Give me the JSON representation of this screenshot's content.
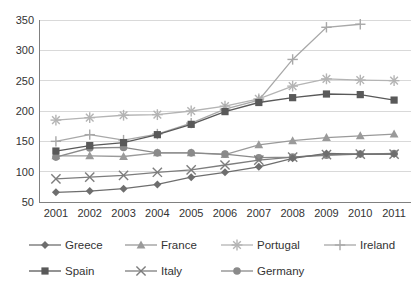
{
  "chart_data": {
    "type": "line",
    "title": "",
    "xlabel": "",
    "ylabel": "",
    "grid": true,
    "legend_position": "bottom",
    "categories": [
      "2001",
      "2002",
      "2003",
      "2004",
      "2005",
      "2006",
      "2007",
      "2008",
      "2009",
      "2010",
      "2011"
    ],
    "x": [
      2001,
      2002,
      2003,
      2004,
      2005,
      2006,
      2007,
      2008,
      2009,
      2010,
      2011
    ],
    "ylim": [
      50,
      350
    ],
    "yticks": [
      50,
      100,
      150,
      200,
      250,
      300,
      350
    ],
    "xticks": [
      "2001",
      "2002",
      "2003",
      "2004",
      "2005",
      "2006",
      "2007",
      "2008",
      "2009",
      "2010",
      "2011"
    ],
    "series": [
      {
        "name": "Greece",
        "marker": "diamond",
        "color": "#6e6e6e",
        "values": [
          66,
          68,
          72,
          79,
          91,
          99,
          108,
          122,
          130,
          129,
          129
        ]
      },
      {
        "name": "France",
        "marker": "triangle",
        "color": "#9a9a9a",
        "values": [
          126,
          126,
          125,
          131,
          131,
          128,
          144,
          151,
          156,
          159,
          162
        ]
      },
      {
        "name": "Portugal",
        "marker": "asterisk",
        "color": "#b4b4b4",
        "values": [
          185,
          189,
          193,
          194,
          200,
          208,
          220,
          241,
          253,
          251,
          250
        ]
      },
      {
        "name": "Ireland",
        "marker": "plus",
        "color": "#a8a8a8",
        "values": [
          150,
          161,
          152,
          162,
          180,
          203,
          218,
          285,
          338,
          343,
          null
        ]
      },
      {
        "name": "Spain",
        "marker": "square",
        "color": "#595959",
        "values": [
          134,
          143,
          148,
          161,
          178,
          199,
          214,
          222,
          228,
          227,
          218
        ]
      },
      {
        "name": "Italy",
        "marker": "cross",
        "color": "#7d7d7d",
        "values": [
          88,
          91,
          94,
          99,
          103,
          111,
          119,
          124,
          128,
          129,
          129
        ]
      },
      {
        "name": "Germany",
        "marker": "circle",
        "color": "#8a8a8a",
        "values": [
          124,
          139,
          140,
          131,
          131,
          129,
          123,
          124,
          127,
          129,
          130
        ]
      }
    ]
  },
  "legend": {
    "rows": [
      [
        {
          "label": "Greece",
          "marker": "diamond",
          "color": "#6e6e6e"
        },
        {
          "label": "France",
          "marker": "triangle",
          "color": "#9a9a9a"
        },
        {
          "label": "Portugal",
          "marker": "asterisk",
          "color": "#b4b4b4"
        },
        {
          "label": "Ireland",
          "marker": "plus",
          "color": "#a8a8a8"
        }
      ],
      [
        {
          "label": "Spain",
          "marker": "square",
          "color": "#595959"
        },
        {
          "label": "Italy",
          "marker": "cross",
          "color": "#7d7d7d"
        },
        {
          "label": "Germany",
          "marker": "circle",
          "color": "#8a8a8a"
        }
      ]
    ]
  },
  "style": {
    "plot_background": "#ffffff",
    "grid_color": "#d9d9d9",
    "axis_color": "#808080",
    "text_color": "#333333"
  }
}
